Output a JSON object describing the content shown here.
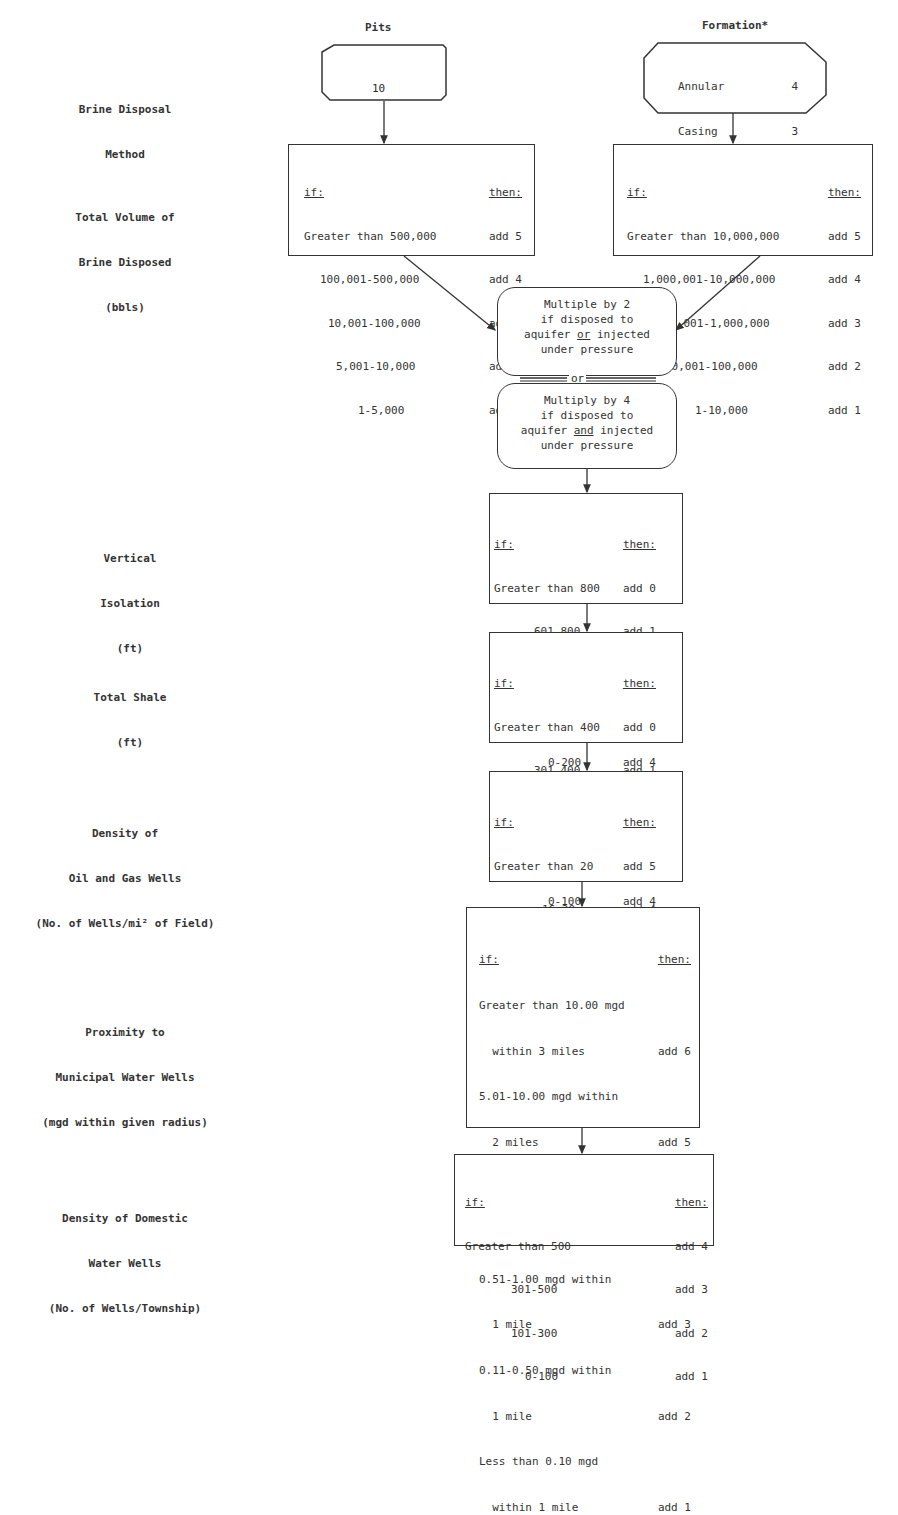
{
  "columns": {
    "pits": "Pits",
    "formation": "Formation*"
  },
  "row_labels": {
    "brine_disposal_method": [
      "Brine Disposal",
      "Method"
    ],
    "total_volume": [
      "Total Volume of",
      "Brine Disposed",
      "(bbls)"
    ],
    "vertical_isolation": [
      "Vertical",
      "Isolation",
      "(ft)"
    ],
    "total_shale": [
      "Total Shale",
      "(ft)"
    ],
    "density_oil_gas": [
      "Density of",
      "Oil and Gas Wells",
      "(No. of Wells/mi² of Field)"
    ],
    "proximity_municipal": [
      "Proximity to",
      "Municipal Water Wells",
      "(mgd within given radius)"
    ],
    "density_domestic": [
      "Density of Domestic",
      "Water Wells",
      "(No. of Wells/Township)"
    ]
  },
  "pits_method": {
    "value": "10"
  },
  "formation_method": {
    "items": [
      {
        "label": "Annular",
        "value": "4"
      },
      {
        "label": "Casing",
        "value": "3"
      },
      {
        "label": "Csg, tbg",
        "value": "2"
      },
      {
        "label": "Csg, tbg, pac",
        "value": "1"
      }
    ]
  },
  "headers": {
    "if": "if:",
    "then": "then:"
  },
  "pits_volume": [
    {
      "cond": "Greater than 500,000",
      "then": "add 5"
    },
    {
      "cond": "100,001-500,000",
      "then": "add 4"
    },
    {
      "cond": "10,001-100,000",
      "then": "add 3"
    },
    {
      "cond": "5,001-10,000",
      "then": "add 2"
    },
    {
      "cond": "1-5,000",
      "then": "add 1"
    }
  ],
  "formation_volume": [
    {
      "cond": "Greater than 10,000,000",
      "then": "add 5"
    },
    {
      "cond": "1,000,001-10,000,000",
      "then": "add 4"
    },
    {
      "cond": "100,001-1,000,000",
      "then": "add 3"
    },
    {
      "cond": "10,001-100,000",
      "then": "add 2"
    },
    {
      "cond": "1-10,000",
      "then": "add 1"
    }
  ],
  "multiplier": {
    "box1": [
      "Multiple by 2",
      "if disposed to",
      "aquifer",
      "or",
      "injected",
      "under pressure"
    ],
    "connector": "or",
    "box2": [
      "Multiply by 4",
      "if disposed to",
      "aquifer",
      "and",
      "injected",
      "under pressure"
    ]
  },
  "vertical_isolation": [
    {
      "cond": "Greater than 800",
      "then": "add 0"
    },
    {
      "cond": "601-800",
      "then": "add 1"
    },
    {
      "cond": "401-600",
      "then": "add 2"
    },
    {
      "cond": "201-400",
      "then": "add 3"
    },
    {
      "cond": "0-200",
      "then": "add 4"
    }
  ],
  "total_shale": [
    {
      "cond": "Greater than 400",
      "then": "add 0"
    },
    {
      "cond": "301-400",
      "then": "add 1"
    },
    {
      "cond": "201-300",
      "then": "add 2"
    },
    {
      "cond": "101-200",
      "then": "add 3"
    },
    {
      "cond": "0-100",
      "then": "add 4"
    }
  ],
  "density_oil_gas": [
    {
      "cond": "Greater than 20",
      "then": "add 5"
    },
    {
      "cond": "16-20",
      "then": "add 4"
    },
    {
      "cond": "11-15",
      "then": "add 3"
    },
    {
      "cond": "6-10",
      "then": "add 2"
    },
    {
      "cond": "1-5",
      "then": "add 1"
    }
  ],
  "proximity_municipal": [
    {
      "cond1": "Greater than 10.00 mgd",
      "cond2": "  within 3 miles",
      "then": "add 6"
    },
    {
      "cond1": "5.01-10.00 mgd within",
      "cond2": "  2 miles",
      "then": "add 5"
    },
    {
      "cond1": "1.01-5.00 mgd within",
      "cond2": "  2 miles",
      "then": "add 4"
    },
    {
      "cond1": "0.51-1.00 mgd within",
      "cond2": "  1 mile",
      "then": "add 3"
    },
    {
      "cond1": "0.11-0.50 mgd within",
      "cond2": "  1 mile",
      "then": "add 2"
    },
    {
      "cond1": "Less than 0.10 mgd",
      "cond2": "  within 1 mile",
      "then": "add 1"
    }
  ],
  "density_domestic": [
    {
      "cond": "Greater than 500",
      "then": "add 4"
    },
    {
      "cond": "301-500",
      "then": "add 3"
    },
    {
      "cond": "101-300",
      "then": "add 2"
    },
    {
      "cond": "0-100",
      "then": "add 1"
    }
  ]
}
